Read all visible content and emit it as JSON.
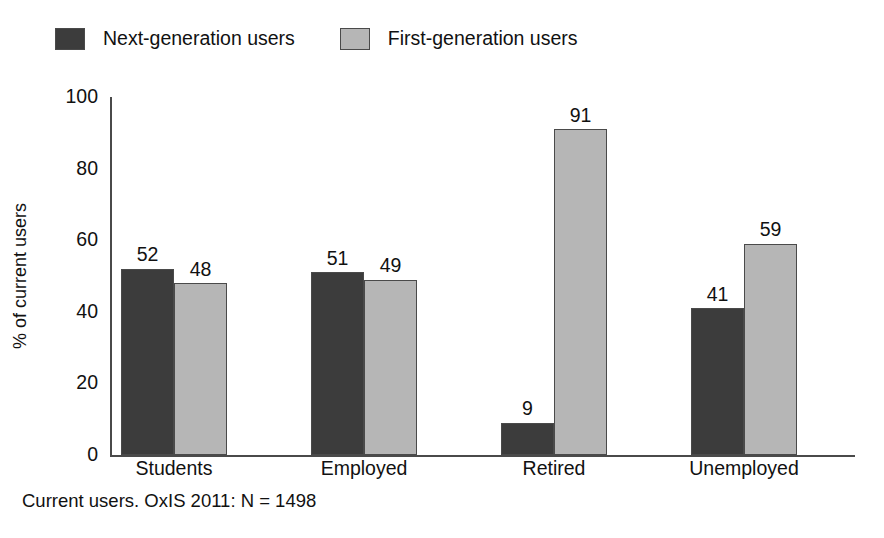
{
  "chart_data": {
    "type": "bar",
    "title": "",
    "subtitle": "",
    "xlabel": "",
    "ylabel": "% of current users",
    "ylim": [
      0,
      100
    ],
    "yticks": [
      "0",
      "20",
      "40",
      "60",
      "80",
      "100"
    ],
    "grid": false,
    "legend_position": "top-left",
    "categories": [
      "Students",
      "Employed",
      "Retired",
      "Unemployed"
    ],
    "series": [
      {
        "name": "Next-generation users",
        "color": "#3c3c3c",
        "values": [
          52,
          51,
          9,
          41
        ],
        "labels": [
          "52",
          "51",
          "9",
          "41"
        ]
      },
      {
        "name": "First-generation users",
        "color": "#b6b6b6",
        "values": [
          48,
          49,
          91,
          59
        ],
        "labels": [
          "48",
          "49",
          "91",
          "59"
        ]
      }
    ],
    "annotations": [
      "Current users. OxIS 2011: N = 1498"
    ]
  },
  "legend": {
    "items": [
      {
        "label": "Next-generation users",
        "swatch": "dark"
      },
      {
        "label": "First-generation users",
        "swatch": "light"
      }
    ]
  },
  "axis": {
    "y_label": "% of current users",
    "y_ticks": [
      "100",
      "80",
      "60",
      "40",
      "20",
      "0"
    ]
  },
  "footnote": {
    "text": "Current users. OxIS 2011: N = 1498"
  }
}
